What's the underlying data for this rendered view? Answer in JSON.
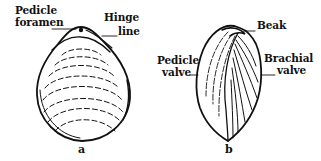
{
  "figure": {
    "colors": {
      "ink": "#111111",
      "background": "#ffffff"
    },
    "panels": [
      {
        "id": "a",
        "letter": "a",
        "view": "dorsal",
        "labels": {
          "pedicle_foramen_line1": "Pedicle",
          "pedicle_foramen_line2": "foramen",
          "hinge_line_line1": "Hinge",
          "hinge_line_line2": "line"
        }
      },
      {
        "id": "b",
        "letter": "b",
        "view": "lateral",
        "labels": {
          "beak": "Beak",
          "pedicle_valve_line1": "Pedicle",
          "pedicle_valve_line2": "valve",
          "brachial_valve_line1": "Brachial",
          "brachial_valve_line2": "valve"
        }
      }
    ]
  }
}
